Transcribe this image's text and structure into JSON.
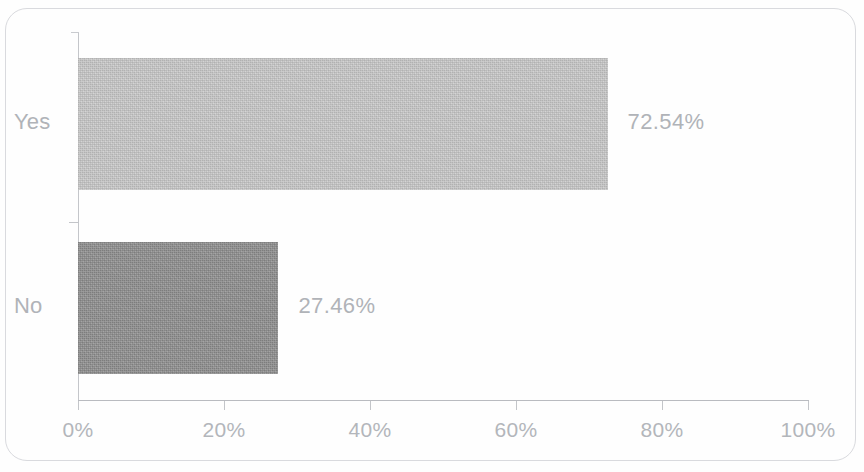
{
  "chart_data": {
    "type": "bar",
    "orientation": "horizontal",
    "title": "",
    "xlabel": "",
    "ylabel": "",
    "categories": [
      "Yes",
      "No"
    ],
    "values": [
      72.54,
      27.46
    ],
    "value_labels": [
      "72.54%",
      "27.46%"
    ],
    "xlim": [
      0,
      100
    ],
    "xticks": [
      0,
      20,
      40,
      60,
      80,
      100
    ],
    "xtick_labels": [
      "0%",
      "20%",
      "40%",
      "60%",
      "80%",
      "100%"
    ],
    "grid": false,
    "legend": false,
    "series": [
      {
        "name": "Response share",
        "values": [
          72.54,
          27.46
        ]
      }
    ],
    "bar_colors": [
      "#c9c9c9",
      "#8e8e8e"
    ],
    "axis_color": "#c3c5c9",
    "label_color": "#b0b3b8",
    "frame_color": "#d9dade",
    "background": "#fefefe"
  },
  "frame": {
    "cropped_title_remnant": ""
  },
  "axis": {
    "tick_labels": [
      "0%",
      "20%",
      "40%",
      "60%",
      "80%",
      "100%"
    ]
  },
  "bars": [
    {
      "category": "Yes",
      "value": 72.54,
      "value_label": "72.54%",
      "color": "#c9c9c9"
    },
    {
      "category": "No",
      "value": 27.46,
      "value_label": "27.46%",
      "color": "#8e8e8e"
    }
  ]
}
